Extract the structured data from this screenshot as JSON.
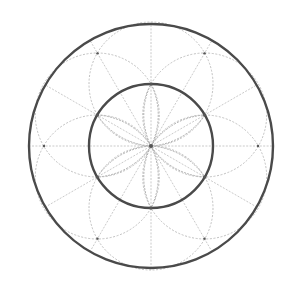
{
  "diagram": {
    "type": "geometric-construction",
    "center": [
      151,
      146
    ],
    "outer_circle_radius": 122,
    "inner_circle_radius": 62,
    "guide_circle_count": 6,
    "guide_circle_radius": 62,
    "guide_circle_center_angles_deg": [
      30,
      90,
      150,
      210,
      270,
      330
    ],
    "ray_angles_deg": [
      0,
      30,
      60,
      90,
      120,
      150
    ],
    "petal_count": 6,
    "petal_angles_deg": [
      30,
      90,
      150,
      210,
      270,
      330
    ],
    "outer_node_radius": 107,
    "outer_node_angles_deg": [
      0,
      60,
      120,
      180,
      240,
      300
    ],
    "colors": {
      "main_stroke": "#4a4a4a",
      "guide_stroke": "#b9b9b9",
      "background": "#ffffff"
    }
  }
}
